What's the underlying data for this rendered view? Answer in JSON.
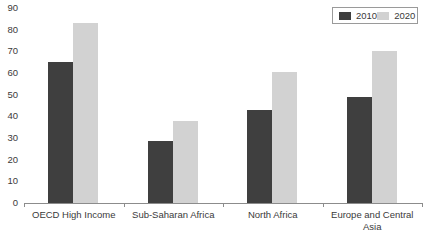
{
  "chart_data": {
    "type": "bar",
    "title": "",
    "subtitle": "",
    "xlabel": "",
    "ylabel": "",
    "categories": [
      "OECD High Income",
      "Sub-Saharan Africa",
      "North Africa",
      "Europe and Central Asia"
    ],
    "series": [
      {
        "name": "2010",
        "color": "#3f3f3f",
        "values": [
          65,
          28.5,
          43,
          49
        ]
      },
      {
        "name": "2020",
        "color": "#d2d2d2",
        "values": [
          83,
          38,
          60.5,
          70
        ]
      }
    ],
    "ylim": [
      0,
      90
    ],
    "ytick_labels": [
      "90",
      "80",
      "70",
      "60",
      "50",
      "40",
      "30",
      "20",
      "10",
      "0"
    ],
    "ytick_values": [
      90,
      80,
      70,
      60,
      50,
      40,
      30,
      20,
      10,
      0
    ],
    "grid": false,
    "legend_position": "top-right",
    "legend_entries": [
      "2010",
      "2020"
    ]
  }
}
